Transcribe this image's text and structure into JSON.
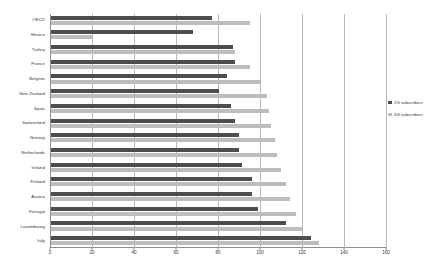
{
  "chart_data": {
    "type": "bar",
    "orientation": "horizontal",
    "title": "",
    "subtitle": "",
    "xlabel": "",
    "ylabel": "",
    "xlim": [
      0,
      160
    ],
    "ylim": null,
    "grid": true,
    "grid_axis": "x",
    "legend_position": "right",
    "xticks": [
      0,
      20,
      40,
      60,
      80,
      100,
      120,
      140,
      160
    ],
    "categories": [
      "OECD",
      "Mexico",
      "Turkey",
      "France",
      "Belgium",
      "New Zealand",
      "Spain",
      "Switzerland",
      "Norway",
      "Netherlands",
      "Ireland",
      "Finland",
      "Austria",
      "Portugal",
      "Luxembourg",
      "Italy"
    ],
    "series": [
      {
        "name": "2G subscribers",
        "color": "#4d4d4d",
        "values": [
          77,
          68,
          87,
          88,
          84,
          80,
          86,
          88,
          90,
          90,
          91,
          96,
          96,
          99,
          112,
          124
        ]
      },
      {
        "name": "3G subscribers",
        "color": "#bdbdbd",
        "values": [
          95,
          20,
          88,
          95,
          100,
          103,
          104,
          105,
          107,
          108,
          110,
          112,
          114,
          117,
          120,
          128
        ]
      }
    ]
  },
  "legend": {
    "items": [
      {
        "label": "2G subscribers",
        "color": "#4d4d4d"
      },
      {
        "label": "3G subscribers",
        "color": "#bdbdbd"
      }
    ]
  },
  "colors": {
    "series_2g": "#4d4d4d",
    "series_3g": "#bdbdbd",
    "grid": "#b9b9b9",
    "axis": "#8e8e8e",
    "text": "#3a3a3a",
    "background": "#ffffff"
  }
}
